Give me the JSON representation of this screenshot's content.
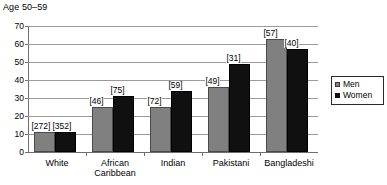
{
  "chart_data": {
    "type": "bar",
    "title": "Age 50–59",
    "xlabel": "",
    "ylabel": "",
    "ylim": [
      0,
      70
    ],
    "yticks": [
      0,
      10,
      20,
      30,
      40,
      50,
      60,
      70
    ],
    "grid": true,
    "legend_position": "right",
    "categories": [
      "White",
      "African\nCaribbean",
      "Indian",
      "Pakistani",
      "Bangladeshi"
    ],
    "series": [
      {
        "name": "Men",
        "color": "#808080",
        "values": [
          11,
          25,
          25,
          36,
          63
        ],
        "point_labels": [
          "[272]",
          "[46]",
          "[72]",
          "[49]",
          "[57]"
        ]
      },
      {
        "name": "Women",
        "color": "#101010",
        "values": [
          11,
          31,
          34,
          49,
          57
        ],
        "point_labels": [
          "[352]",
          "[75]",
          "[59]",
          "[31]",
          "[40]"
        ]
      }
    ]
  },
  "legend": {
    "items": [
      {
        "label": "Men",
        "swatch": "men-swatch"
      },
      {
        "label": "Women",
        "swatch": "women-swatch"
      }
    ]
  }
}
